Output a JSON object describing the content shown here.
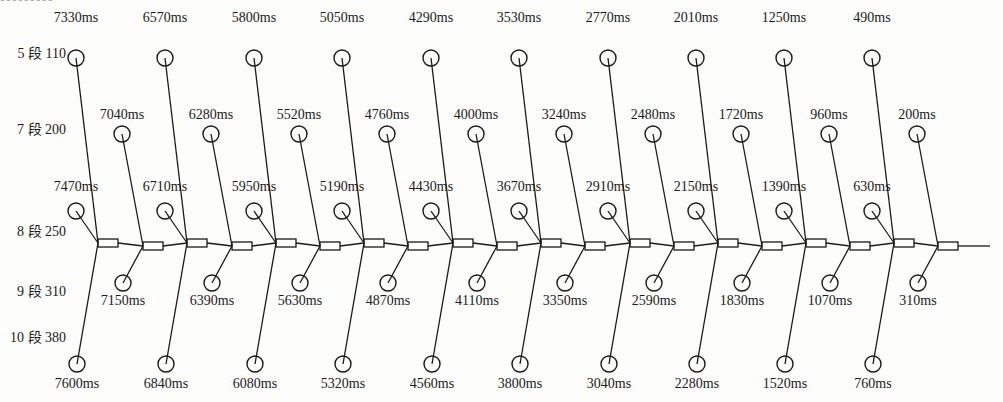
{
  "header_cutoff": "▪▪▪▪▪▪▪▪▪",
  "row_labels": [
    {
      "text": "5 段 110",
      "y": 58
    },
    {
      "text": "7 段 200",
      "y": 134
    },
    {
      "text": "8 段 250",
      "y": 236
    },
    {
      "text": "9 段 310",
      "y": 296
    },
    {
      "text": "10 段 380",
      "y": 342
    }
  ],
  "odd_groups": [
    {
      "jx": 98,
      "top": "7330ms",
      "mid": "7470ms",
      "bot": "7600ms"
    },
    {
      "jx": 187,
      "top": "6570ms",
      "mid": "6710ms",
      "bot": "6840ms"
    },
    {
      "jx": 276,
      "top": "5800ms",
      "mid": "5950ms",
      "bot": "6080ms"
    },
    {
      "jx": 364,
      "top": "5050ms",
      "mid": "5190ms",
      "bot": "5320ms"
    },
    {
      "jx": 453,
      "top": "4290ms",
      "mid": "4430ms",
      "bot": "4560ms"
    },
    {
      "jx": 541,
      "top": "3530ms",
      "mid": "3670ms",
      "bot": "3800ms"
    },
    {
      "jx": 630,
      "top": "2770ms",
      "mid": "2910ms",
      "bot": "3040ms"
    },
    {
      "jx": 718,
      "top": "2010ms",
      "mid": "2150ms",
      "bot": "2280ms"
    },
    {
      "jx": 806,
      "top": "1250ms",
      "mid": "1390ms",
      "bot": "1520ms"
    },
    {
      "jx": 894,
      "top": "490ms",
      "mid": "630ms",
      "bot": "760ms"
    }
  ],
  "even_groups": [
    {
      "jx": 143,
      "top": "7040ms",
      "bot": "7150ms"
    },
    {
      "jx": 232,
      "top": "6280ms",
      "bot": "6390ms"
    },
    {
      "jx": 320,
      "top": "5520ms",
      "bot": "5630ms"
    },
    {
      "jx": 408,
      "top": "4760ms",
      "bot": "4870ms"
    },
    {
      "jx": 497,
      "top": "4000ms",
      "bot": "4110ms"
    },
    {
      "jx": 585,
      "top": "3240ms",
      "bot": "3350ms"
    },
    {
      "jx": 674,
      "top": "2480ms",
      "bot": "2590ms"
    },
    {
      "jx": 762,
      "top": "1720ms",
      "bot": "1830ms"
    },
    {
      "jx": 850,
      "top": "960ms",
      "bot": "1070ms"
    },
    {
      "jx": 938,
      "top": "200ms",
      "bot": "310ms"
    }
  ],
  "colors": {
    "ink": "#1a1a1a",
    "paper": "#fdfdfb"
  }
}
